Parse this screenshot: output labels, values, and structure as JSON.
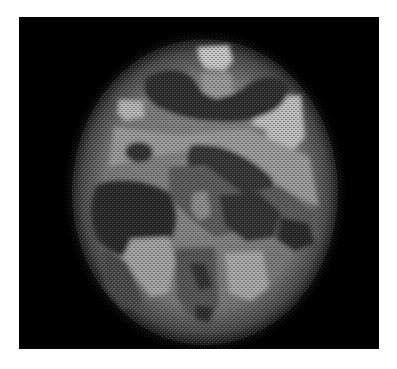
{
  "image": {
    "description": "Grayscale axial brain scan rendered with a dithered halftone texture on a black background",
    "alt": "Dithered grayscale axial brain scan",
    "background_color": "#000000",
    "page_color": "#ffffff",
    "tones": {
      "dark": "#3a3a3a",
      "mid": "#6e6e6e",
      "light": "#a8a8a8",
      "bright": "#d4d4d4"
    }
  }
}
